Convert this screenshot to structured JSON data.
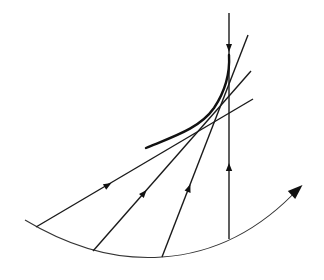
{
  "diagram": {
    "colors": {
      "stroke": "#1a1a1a",
      "background": "#ffffff"
    },
    "rays": [
      {
        "id": "ray-1",
        "x1": 36,
        "y1": 227,
        "x2": 253,
        "y2": 99,
        "arrow": {
          "x": 108,
          "y": 185,
          "direction": "forward"
        }
      },
      {
        "id": "ray-2",
        "x1": 93,
        "y1": 251,
        "x2": 251,
        "y2": 71,
        "arrow": {
          "x": 144,
          "y": 193,
          "direction": "forward"
        }
      },
      {
        "id": "ray-3",
        "x1": 162,
        "y1": 257,
        "x2": 248,
        "y2": 35,
        "arrow": {
          "x": 189,
          "y": 188,
          "direction": "forward"
        }
      },
      {
        "id": "ray-4",
        "x1": 229,
        "y1": 239,
        "x2": 229,
        "y2": 13,
        "arrow": {
          "x": 229,
          "y": 167,
          "direction": "forward"
        }
      }
    ],
    "vertical_down_arrow": {
      "x": 229,
      "y": 48
    },
    "base_arc": {
      "path": "M 25 220 Q 95 262 162 257 Q 240 252 300 187"
    },
    "arc_arrowhead": {
      "tip_x": 303,
      "tip_y": 184
    },
    "envelope_curve": {
      "path": "M 146 148 C 175 136 200 128 214 108 C 226 90 230 72 229 55"
    }
  }
}
